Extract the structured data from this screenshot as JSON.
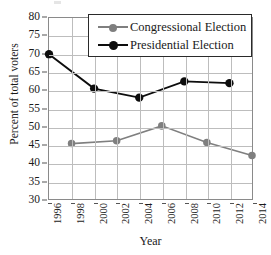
{
  "chart_data": {
    "type": "line",
    "title": "",
    "xlabel": "Year",
    "ylabel": "Percent of total voters",
    "x": [
      1996,
      1998,
      2000,
      2002,
      2004,
      2006,
      2008,
      2010,
      2012,
      2014
    ],
    "xtick_labels": [
      "1996",
      "1998",
      "2000",
      "2002",
      "2004",
      "2006",
      "2008",
      "2010",
      "2012",
      "2014"
    ],
    "xlim": [
      1996,
      2014
    ],
    "ylim": [
      30,
      80
    ],
    "ytick_labels": [
      "80",
      "75",
      "70",
      "65",
      "60",
      "55",
      "50",
      "45",
      "40",
      "35",
      "30"
    ],
    "ytick_values": [
      80,
      75,
      70,
      65,
      60,
      55,
      50,
      45,
      40,
      35,
      30
    ],
    "grid": true,
    "legend_position": "top-right-inside",
    "series": [
      {
        "name": "Congressional Election",
        "color": "#7f7f7f",
        "marker": "circle",
        "x": [
          1998,
          2002,
          2006,
          2010,
          2014
        ],
        "values": [
          45.3,
          46.1,
          50.2,
          45.6,
          42.0
        ]
      },
      {
        "name": "Presidential Election",
        "color": "#0d0d0d",
        "marker": "circle",
        "x": [
          1996,
          2000,
          2004,
          2008,
          2012
        ],
        "values": [
          70.0,
          60.5,
          58.0,
          62.5,
          62.0
        ]
      }
    ]
  },
  "legend": {
    "entries": [
      {
        "label": "Congressional Election",
        "color": "#7f7f7f"
      },
      {
        "label": "Presidential Election",
        "color": "#0d0d0d"
      }
    ]
  },
  "axis_titles": {
    "x": "Year",
    "y": "Percent of total voters"
  },
  "colors": {
    "grid": "#bdbdbd",
    "frame": "#8a8a8a",
    "congressional": "#7f7f7f",
    "presidential": "#0d0d0d",
    "background": "#ffffff"
  }
}
